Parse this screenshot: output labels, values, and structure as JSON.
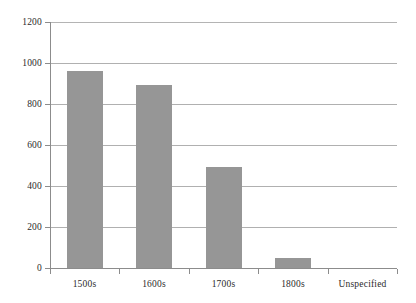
{
  "chart_data": {
    "type": "bar",
    "title": "",
    "subtitle": "",
    "xlabel": "",
    "ylabel": "",
    "categories": [
      "1500s",
      "1600s",
      "1700s",
      "1800s",
      "Unspecified"
    ],
    "values": [
      960,
      895,
      495,
      50,
      0
    ],
    "series": [
      {
        "name": "Count",
        "values": [
          960,
          895,
          495,
          50,
          0
        ]
      }
    ],
    "ylim": [
      0,
      1200
    ],
    "yticks": [
      0,
      200,
      400,
      600,
      800,
      1000,
      1200
    ],
    "ytick_labels": [
      "0",
      "200",
      "400",
      "600",
      "800",
      "1000",
      "1200"
    ],
    "grid": "horizontal",
    "legend": "none",
    "bar_color": "#969696",
    "axis_color": "#8c8c8c",
    "gridline_color": "#b0b0b0",
    "text_color": "#2b2b2b",
    "background": "#ffffff"
  },
  "axes": {
    "y_tick_labels": [
      "1200",
      "1000",
      "800",
      "600",
      "400",
      "200",
      "0"
    ],
    "x_tick_labels": [
      "1500s",
      "1600s",
      "1700s",
      "1800s",
      "Unspecified"
    ]
  }
}
